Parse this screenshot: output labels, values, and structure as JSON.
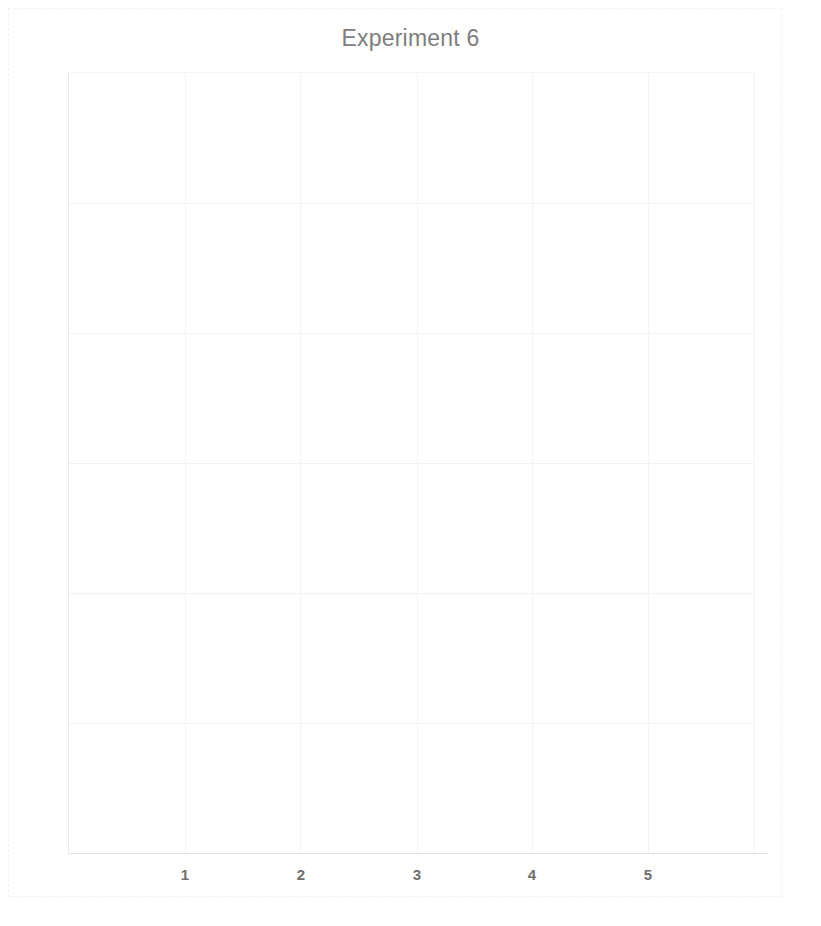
{
  "chart_data": {
    "type": "line",
    "title": "Experiment 6",
    "subtitle": "",
    "xlabel": "",
    "ylabel": "",
    "x_tick_labels": [
      "1",
      "2",
      "3",
      "4",
      "5"
    ],
    "x_tick_values": [
      1,
      2,
      3,
      4,
      5
    ],
    "y_tick_labels": [],
    "y_tick_values": [],
    "xlim": [
      0.4,
      6.0
    ],
    "ylim": [
      0,
      1
    ],
    "series": [],
    "values": [],
    "categories": [],
    "annotations": [],
    "legend": {
      "entries": [],
      "position": "none",
      "visible": false
    },
    "grid": {
      "visible": true,
      "vertical_count": 6,
      "horizontal_count": 5,
      "color": "#f2f2f2"
    },
    "empty": true,
    "note": "Plot area contains no plotted data; only faint gridlines are rendered."
  },
  "figure": {
    "title": "Experiment 6",
    "title_color": "#7d7d7d",
    "background_color": "#ffffff",
    "border_color": "#f2f2f2",
    "axis_color": "#e2e2e2",
    "gridline_color": "#f2f2f2",
    "tick_label_color": "#6f6f6f"
  },
  "xticks": [
    {
      "label": "1",
      "left": 185
    },
    {
      "label": "2",
      "left": 301
    },
    {
      "label": "3",
      "left": 417
    },
    {
      "label": "4",
      "left": 532
    },
    {
      "label": "5",
      "left": 648
    }
  ],
  "gridlines": {
    "vertical_left": [
      0,
      117,
      232,
      349,
      464,
      580,
      686
    ],
    "horizontal_top": [
      131,
      261,
      391,
      521,
      651
    ]
  }
}
